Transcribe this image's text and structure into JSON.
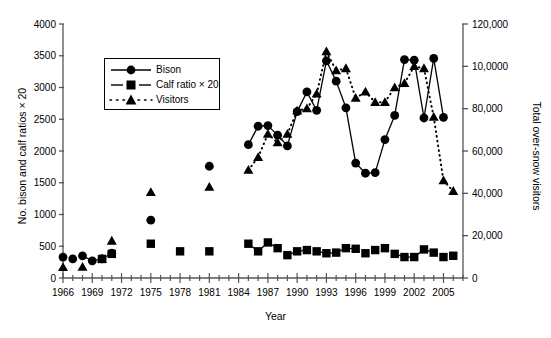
{
  "figure": {
    "xlabel": "Year",
    "ylabel_left": "No. bison and calf ratios × 20",
    "ylabel_right": "Total over-snow visitors"
  },
  "legend": {
    "items": [
      {
        "label": "Bison",
        "marker": "circle",
        "line": "solid"
      },
      {
        "label": "Calf ratio × 20",
        "marker": "square",
        "line": "solid"
      },
      {
        "label": "Visitors",
        "marker": "triangle",
        "line": "dotted"
      }
    ]
  },
  "axes": {
    "x_ticks": [
      "1966",
      "1969",
      "1972",
      "1975",
      "1978",
      "1981",
      "1984",
      "1987",
      "1990",
      "1993",
      "1996",
      "1999",
      "2002",
      "2005"
    ],
    "y_left_ticks": [
      "0",
      "500",
      "1000",
      "1500",
      "2000",
      "2500",
      "3000",
      "3500",
      "4000"
    ],
    "y_right_ticks": [
      "0",
      "20,000",
      "40,000",
      "60,000",
      "80,000",
      "10,0000",
      "120,000"
    ]
  },
  "chart_data": {
    "type": "line",
    "title": "",
    "xlabel": "Year",
    "ylabel": "No. bison and calf ratios × 20",
    "ylabel_secondary": "Total over-snow visitors",
    "xlim": [
      1966,
      2007
    ],
    "ylim": [
      0,
      4000
    ],
    "ylim_secondary": [
      0,
      120000
    ],
    "grid": false,
    "legend_position": "upper-left-inside",
    "xticks": [
      1966,
      1969,
      1972,
      1975,
      1978,
      1981,
      1984,
      1987,
      1990,
      1993,
      1996,
      1999,
      2002,
      2005
    ],
    "yticks": [
      0,
      500,
      1000,
      1500,
      2000,
      2500,
      3000,
      3500,
      4000
    ],
    "yticks_secondary": [
      0,
      20000,
      40000,
      60000,
      80000,
      100000,
      120000
    ],
    "series": [
      {
        "name": "Bison",
        "marker": "circle",
        "linestyle": "solid",
        "axis": "left",
        "points": [
          {
            "x": 1966,
            "y": 330,
            "connected": false
          },
          {
            "x": 1967,
            "y": 300,
            "connected": false
          },
          {
            "x": 1968,
            "y": 350,
            "connected": false
          },
          {
            "x": 1969,
            "y": 270,
            "connected": true
          },
          {
            "x": 1970,
            "y": 300,
            "connected": true
          },
          {
            "x": 1971,
            "y": 390,
            "connected": true
          },
          {
            "x": 1975,
            "y": 910,
            "connected": false
          },
          {
            "x": 1981,
            "y": 1760,
            "connected": false
          },
          {
            "x": 1985,
            "y": 2100,
            "connected": true
          },
          {
            "x": 1986,
            "y": 2390,
            "connected": true
          },
          {
            "x": 1987,
            "y": 2400,
            "connected": true
          },
          {
            "x": 1988,
            "y": 2250,
            "connected": true
          },
          {
            "x": 1989,
            "y": 2080,
            "connected": true
          },
          {
            "x": 1990,
            "y": 2620,
            "connected": true
          },
          {
            "x": 1991,
            "y": 2930,
            "connected": true
          },
          {
            "x": 1992,
            "y": 2640,
            "connected": true
          },
          {
            "x": 1993,
            "y": 3420,
            "connected": true
          },
          {
            "x": 1994,
            "y": 3100,
            "connected": true
          },
          {
            "x": 1995,
            "y": 2680,
            "connected": true
          },
          {
            "x": 1996,
            "y": 1810,
            "connected": true
          },
          {
            "x": 1997,
            "y": 1650,
            "connected": true
          },
          {
            "x": 1998,
            "y": 1660,
            "connected": true
          },
          {
            "x": 1999,
            "y": 2180,
            "connected": true
          },
          {
            "x": 2000,
            "y": 2560,
            "connected": true
          },
          {
            "x": 2001,
            "y": 3440,
            "connected": true
          },
          {
            "x": 2002,
            "y": 3430,
            "connected": true
          },
          {
            "x": 2003,
            "y": 2520,
            "connected": true
          },
          {
            "x": 2004,
            "y": 3460,
            "connected": true
          },
          {
            "x": 2005,
            "y": 2530,
            "connected": true
          }
        ]
      },
      {
        "name": "Calf ratio × 20",
        "marker": "square",
        "linestyle": "solid",
        "axis": "left",
        "points": [
          {
            "x": 1970,
            "y": 300,
            "connected": false
          },
          {
            "x": 1971,
            "y": 380,
            "connected": false
          },
          {
            "x": 1975,
            "y": 540,
            "connected": false
          },
          {
            "x": 1978,
            "y": 420,
            "connected": false
          },
          {
            "x": 1981,
            "y": 420,
            "connected": false
          },
          {
            "x": 1985,
            "y": 540,
            "connected": true
          },
          {
            "x": 1986,
            "y": 420,
            "connected": true
          },
          {
            "x": 1987,
            "y": 560,
            "connected": true
          },
          {
            "x": 1988,
            "y": 470,
            "connected": true
          },
          {
            "x": 1989,
            "y": 360,
            "connected": false
          },
          {
            "x": 1990,
            "y": 420,
            "connected": true
          },
          {
            "x": 1991,
            "y": 440,
            "connected": true
          },
          {
            "x": 1992,
            "y": 420,
            "connected": false
          },
          {
            "x": 1993,
            "y": 390,
            "connected": true
          },
          {
            "x": 1994,
            "y": 400,
            "connected": true
          },
          {
            "x": 1995,
            "y": 470,
            "connected": true
          },
          {
            "x": 1996,
            "y": 460,
            "connected": true
          },
          {
            "x": 1997,
            "y": 390,
            "connected": false
          },
          {
            "x": 1998,
            "y": 440,
            "connected": false
          },
          {
            "x": 1999,
            "y": 470,
            "connected": false
          },
          {
            "x": 2000,
            "y": 380,
            "connected": false
          },
          {
            "x": 2001,
            "y": 330,
            "connected": true
          },
          {
            "x": 2002,
            "y": 330,
            "connected": true
          },
          {
            "x": 2003,
            "y": 450,
            "connected": true
          },
          {
            "x": 2004,
            "y": 400,
            "connected": true
          },
          {
            "x": 2005,
            "y": 330,
            "connected": false
          },
          {
            "x": 2006,
            "y": 350,
            "connected": false
          }
        ]
      },
      {
        "name": "Visitors",
        "marker": "triangle",
        "linestyle": "dotted",
        "axis": "right",
        "points": [
          {
            "x": 1966,
            "y": 5000,
            "connected": false
          },
          {
            "x": 1968,
            "y": 5200,
            "connected": false
          },
          {
            "x": 1970,
            "y": 9000,
            "connected": false
          },
          {
            "x": 1971,
            "y": 17500,
            "connected": false
          },
          {
            "x": 1975,
            "y": 40500,
            "connected": false
          },
          {
            "x": 1981,
            "y": 43000,
            "connected": false
          },
          {
            "x": 1985,
            "y": 51000,
            "connected": true
          },
          {
            "x": 1986,
            "y": 57000,
            "connected": true
          },
          {
            "x": 1987,
            "y": 68000,
            "connected": true
          },
          {
            "x": 1988,
            "y": 64000,
            "connected": true
          },
          {
            "x": 1989,
            "y": 68000,
            "connected": true
          },
          {
            "x": 1990,
            "y": 79000,
            "connected": true
          },
          {
            "x": 1991,
            "y": 80000,
            "connected": true
          },
          {
            "x": 1992,
            "y": 87000,
            "connected": true
          },
          {
            "x": 1993,
            "y": 107000,
            "connected": true
          },
          {
            "x": 1994,
            "y": 98000,
            "connected": true
          },
          {
            "x": 1995,
            "y": 99000,
            "connected": true
          },
          {
            "x": 1996,
            "y": 85000,
            "connected": true
          },
          {
            "x": 1997,
            "y": 88000,
            "connected": true
          },
          {
            "x": 1998,
            "y": 83000,
            "connected": true
          },
          {
            "x": 1999,
            "y": 83000,
            "connected": true
          },
          {
            "x": 2000,
            "y": 90000,
            "connected": true
          },
          {
            "x": 2001,
            "y": 92000,
            "connected": true
          },
          {
            "x": 2002,
            "y": 100000,
            "connected": true
          },
          {
            "x": 2003,
            "y": 99000,
            "connected": true
          },
          {
            "x": 2004,
            "y": 76000,
            "connected": true
          },
          {
            "x": 2005,
            "y": 46000,
            "connected": true
          },
          {
            "x": 2006,
            "y": 41000,
            "connected": true
          }
        ]
      }
    ]
  }
}
